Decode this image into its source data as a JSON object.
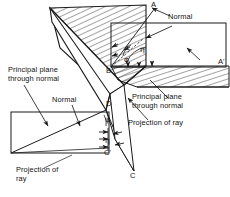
{
  "figure": {
    "background_color": "#ffffff",
    "line_color": "#1a1a1a",
    "hatch_color": "#333333"
  },
  "annotations": {
    "normal_top": "Normal",
    "normal_left": "Normal",
    "principal_plane_left": "Principal plane\nthrough normal",
    "principal_plane_right": "Principal plane\nthrough normal",
    "projection_right": "Projection of ray",
    "projection_left": "Projection of\nray"
  },
  "points": {
    "a": "A",
    "a_prime": "A'",
    "b": "B",
    "c": "C",
    "c_prime": "C'",
    "d": "D"
  },
  "angles": {
    "phi_upper": "φ",
    "eta_upper": "η",
    "psi_lower": "ψ",
    "eta_lower": "η"
  }
}
